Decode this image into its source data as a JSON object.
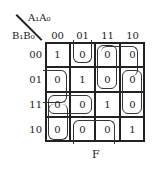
{
  "map": {
    "col_var_label": "A₁A₀",
    "row_var_label": "B₁B₀",
    "col_headers": [
      "00",
      "01",
      "11",
      "10"
    ],
    "row_headers": [
      "00",
      "01",
      "11",
      "10"
    ],
    "cells": [
      [
        "1",
        "0",
        "0",
        "0"
      ],
      [
        "0",
        "1",
        "0",
        "0"
      ],
      [
        "0",
        "0",
        "1",
        "0"
      ],
      [
        "0",
        "0",
        "0",
        "1"
      ]
    ],
    "output_label": "F"
  },
  "groups": [
    {
      "name": "group-col01-row00",
      "desc": "top cell col 01 open upward"
    },
    {
      "name": "group-col11-rows00-01",
      "desc": "col 11 rows 00-01"
    },
    {
      "name": "group-col10-rows00-01-11",
      "desc": "col 10 rows 00-11"
    },
    {
      "name": "group-col00-rows01-11-10",
      "desc": "col 00 rows 01-10"
    },
    {
      "name": "group-row11-cols00-01",
      "desc": "row 11 cols 00-01"
    },
    {
      "name": "group-row10-cols01-11",
      "desc": "row 10 cols 01-11"
    }
  ]
}
